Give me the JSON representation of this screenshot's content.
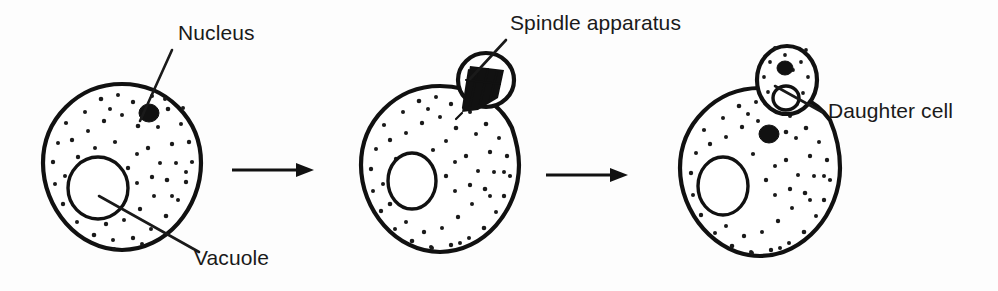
{
  "diagram": {
    "background_color": "#fdfdfd",
    "ink_color": "#111111",
    "stages": [
      {
        "id": "stage-1",
        "name": "mother-cell",
        "center": [
          122,
          163
        ],
        "radius": 79,
        "vacuole": {
          "cx": 98,
          "cy": 188,
          "rx": 30,
          "ry": 31
        },
        "nucleus": {
          "cx": 149,
          "cy": 113,
          "rx": 10,
          "ry": 9
        },
        "bud": null
      },
      {
        "id": "stage-2",
        "name": "cell-with-spindle-apparatus",
        "center": [
          440,
          165
        ],
        "radius": 79,
        "vacuole": {
          "cx": 412,
          "cy": 181,
          "rx": 24,
          "ry": 28
        },
        "nucleus": null,
        "bud": {
          "cx": 486,
          "cy": 80,
          "rx": 28,
          "ry": 27,
          "contents": "spindle-apparatus"
        }
      },
      {
        "id": "stage-3",
        "name": "cell-with-daughter-cell",
        "center": [
          760,
          168
        ],
        "radius": 80,
        "vacuole": {
          "cx": 723,
          "cy": 186,
          "rx": 25,
          "ry": 29
        },
        "nucleus": {
          "cx": 769,
          "cy": 134,
          "rx": 10,
          "ry": 9
        },
        "bud": {
          "cx": 787,
          "cy": 80,
          "rx": 30,
          "ry": 34,
          "contents": "daughter-cell"
        }
      }
    ],
    "arrows": [
      {
        "name": "arrow-stage1-to-stage2",
        "x1": 232,
        "y1": 170,
        "x2": 312,
        "y2": 170
      },
      {
        "name": "arrow-stage2-to-stage3",
        "x1": 546,
        "y1": 175,
        "x2": 626,
        "y2": 175
      }
    ],
    "labels": [
      {
        "id": "label-nucleus",
        "text": "Nucleus",
        "text_x": 178,
        "text_y": 40,
        "leader": {
          "x1": 172,
          "y1": 50,
          "x2": 146,
          "y2": 108
        }
      },
      {
        "id": "label-vacuole",
        "text": "Vacuole",
        "text_x": 190,
        "text_y": 262,
        "leader": {
          "x1": 99,
          "y1": 196,
          "x2": 196,
          "y2": 250
        }
      },
      {
        "id": "label-spindle-apparatus",
        "text": "Spindle apparatus",
        "text_x": 508,
        "text_y": 30,
        "leader": {
          "x1": 504,
          "y1": 40,
          "x2": 476,
          "y2": 78
        }
      },
      {
        "id": "label-daughter-cell",
        "text": "Daughter cell",
        "text_x": 826,
        "text_y": 118,
        "leader": {
          "x1": 818,
          "y1": 110,
          "x2": 777,
          "y2": 88
        }
      }
    ]
  }
}
